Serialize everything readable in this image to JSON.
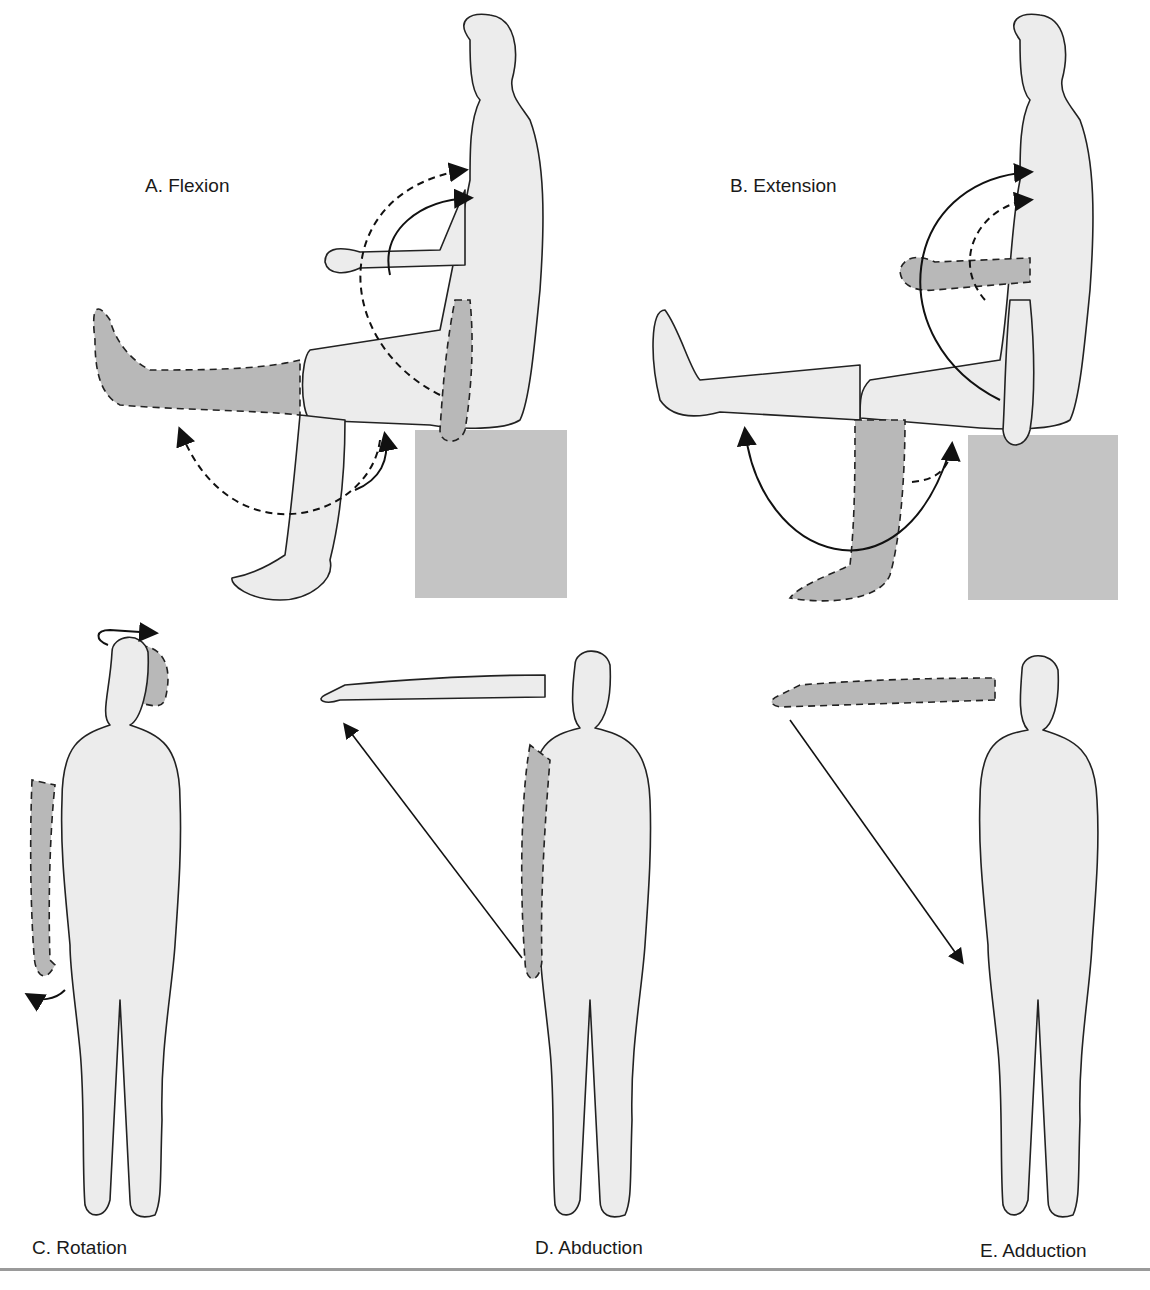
{
  "figure": {
    "panels": [
      {
        "id": "A",
        "label": "A. Flexion",
        "pose": "seated-side",
        "movement": "flexion"
      },
      {
        "id": "B",
        "label": "B. Extension",
        "pose": "seated-side",
        "movement": "extension"
      },
      {
        "id": "C",
        "label": "C. Rotation",
        "pose": "standing-front",
        "movement": "rotation"
      },
      {
        "id": "D",
        "label": "D. Abduction",
        "pose": "standing-front",
        "movement": "abduction"
      },
      {
        "id": "E",
        "label": "E. Adduction",
        "pose": "standing-front",
        "movement": "adduction"
      }
    ],
    "colors": {
      "body_fill": "#ececec",
      "shaded_fill": "#b8b8b8",
      "outline": "#222222",
      "box_fill": "#c4c4c4"
    }
  }
}
